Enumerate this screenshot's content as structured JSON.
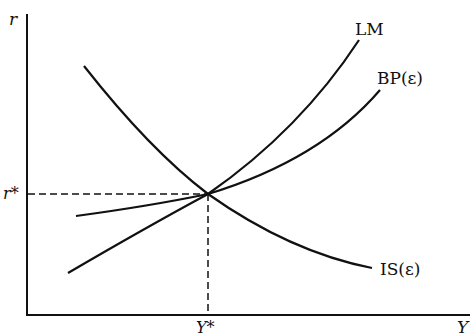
{
  "diagram": {
    "type": "IS-LM-BP equilibrium diagram",
    "axes": {
      "y_label": "r",
      "x_label": "Y"
    },
    "equilibrium": {
      "r_label": "r*",
      "y_label": "Y*"
    },
    "curves": [
      {
        "id": "lm",
        "label": "LM",
        "slope": "upward, steeper"
      },
      {
        "id": "bp",
        "label": "BP(ε)",
        "slope": "upward, flatter"
      },
      {
        "id": "is",
        "label": "IS(ε)",
        "slope": "downward"
      }
    ],
    "colors": {
      "line": "#111111",
      "background": "#ffffff"
    }
  }
}
